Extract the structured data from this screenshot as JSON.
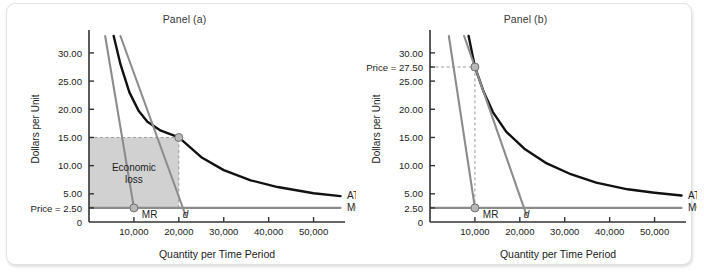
{
  "figure": {
    "background_color": "#ffffff",
    "frame_color": "#e2e2e2"
  },
  "colors": {
    "atc_curve": "#111111",
    "mc_avc_line": "#8c8c8c",
    "demand_line": "#8c8c8c",
    "mr_line": "#8c8c8c",
    "loss_fill": "#cfcfcf",
    "marker_fill": "#b8b8b8",
    "marker_stroke": "#6f6f6f",
    "axis": "#333333",
    "dashed_guide": "#9a9a9a",
    "text": "#1c1c1c"
  },
  "panels": [
    {
      "id": "panel-a",
      "title": "Panel (a)",
      "axis_titles": {
        "y": "Dollars per Unit",
        "x": "Quantity per Time Period"
      },
      "y_ticks": [
        {
          "value": 30.0,
          "label": "30.00"
        },
        {
          "value": 25.0,
          "label": "25.00"
        },
        {
          "value": 20.0,
          "label": "20.00"
        },
        {
          "value": 15.0,
          "label": "15.00"
        },
        {
          "value": 10.0,
          "label": "10.00"
        },
        {
          "value": 5.0,
          "label": "5.00"
        },
        {
          "value": 2.5,
          "label": "Price = 2.50"
        },
        {
          "value": 0.0,
          "label": "0"
        }
      ],
      "x_ticks": [
        {
          "value": 10000,
          "label": "10,000"
        },
        {
          "value": 20000,
          "label": "20,000"
        },
        {
          "value": 30000,
          "label": "30,000"
        },
        {
          "value": 40000,
          "label": "40,000"
        },
        {
          "value": 50000,
          "label": "50,000"
        }
      ],
      "curve_labels": [
        {
          "name": "ATC",
          "text": "ATC"
        },
        {
          "name": "MC = AVC",
          "text": "MC = AVC"
        }
      ],
      "inline_labels": [
        {
          "name": "MR",
          "text": "MR"
        },
        {
          "name": "d",
          "text": "d"
        }
      ],
      "region_label": {
        "line1": "Economic",
        "line2": "loss"
      },
      "price": 2.5,
      "price_label": "Price = 2.50"
    },
    {
      "id": "panel-b",
      "title": "Panel (b)",
      "axis_titles": {
        "y": "Dollars per Unit",
        "x": "Quantity per Time Period"
      },
      "y_ticks": [
        {
          "value": 30.0,
          "label": "30.00"
        },
        {
          "value": 27.5,
          "label": "Price = 27.50"
        },
        {
          "value": 25.0,
          "label": "25.00"
        },
        {
          "value": 20.0,
          "label": "20.00"
        },
        {
          "value": 15.0,
          "label": "15.00"
        },
        {
          "value": 10.0,
          "label": "10.00"
        },
        {
          "value": 5.0,
          "label": "5.00"
        },
        {
          "value": 2.5,
          "label": "2.50"
        },
        {
          "value": 0.0,
          "label": "0"
        }
      ],
      "x_ticks": [
        {
          "value": 10000,
          "label": "10,000"
        },
        {
          "value": 20000,
          "label": "20,000"
        },
        {
          "value": 30000,
          "label": "30,000"
        },
        {
          "value": 40000,
          "label": "40,000"
        },
        {
          "value": 50000,
          "label": "50,000"
        }
      ],
      "curve_labels": [
        {
          "name": "ATC",
          "text": "ATC"
        },
        {
          "name": "MC = AVC",
          "text": "MC = AVC"
        }
      ],
      "inline_labels": [
        {
          "name": "MR",
          "text": "MR"
        },
        {
          "name": "d",
          "text": "d"
        }
      ],
      "price": 27.5,
      "price_label": "Price = 27.50"
    }
  ],
  "chart_data": [
    {
      "type": "line",
      "panel": "Panel (a)",
      "title": "Panel (a)",
      "xlabel": "Quantity per Time Period",
      "ylabel": "Dollars per Unit",
      "xlim": [
        0,
        57000
      ],
      "ylim": [
        0,
        33
      ],
      "xticks": [
        10000,
        20000,
        30000,
        40000,
        50000
      ],
      "yticks": [
        0,
        2.5,
        5,
        10,
        15,
        20,
        25,
        30
      ],
      "grid": false,
      "legend_position": "right-inline",
      "annotations": [
        {
          "text": "Economic loss",
          "x": 10000,
          "y": 9.0
        },
        {
          "text": "Price = 2.50",
          "x": 0,
          "y": 2.5
        },
        {
          "text": "MR",
          "x": 13500,
          "y": 1.2
        },
        {
          "text": "d",
          "x": 21500,
          "y": 1.2
        }
      ],
      "markers": [
        {
          "name": "d-atc-intersection",
          "x": 20000,
          "y": 15.0
        },
        {
          "name": "mr-mc-intersection",
          "x": 10000,
          "y": 2.5
        }
      ],
      "guides": [
        {
          "type": "dashed-horizontal",
          "y": 15.0,
          "x_from": 0,
          "x_to": 20000
        },
        {
          "type": "dashed-vertical",
          "x": 20000,
          "y_from": 2.5,
          "y_to": 15.0
        }
      ],
      "shaded_region": {
        "name": "Economic loss",
        "x_from": 0,
        "x_to": 20000,
        "y_from": 2.5,
        "y_to": 15.0,
        "color": "#cfcfcf"
      },
      "series": [
        {
          "name": "ATC",
          "color": "#111111",
          "x": [
            5500,
            7000,
            9000,
            11000,
            13000,
            16000,
            20000,
            25000,
            30000,
            36000,
            42000,
            50000,
            56000
          ],
          "values": [
            33.0,
            28.0,
            23.0,
            19.8,
            17.8,
            16.2,
            15.0,
            11.5,
            9.2,
            7.4,
            6.2,
            5.1,
            4.6
          ]
        },
        {
          "name": "MC = AVC",
          "color": "#8c8c8c",
          "x": [
            0,
            56000
          ],
          "values": [
            2.5,
            2.5
          ]
        },
        {
          "name": "d",
          "color": "#8c8c8c",
          "x": [
            7000,
            21500
          ],
          "values": [
            33.0,
            1.2
          ]
        },
        {
          "name": "MR",
          "color": "#8c8c8c",
          "x": [
            3600,
            10000
          ],
          "values": [
            33.0,
            2.5
          ]
        }
      ]
    },
    {
      "type": "line",
      "panel": "Panel (b)",
      "title": "Panel (b)",
      "xlabel": "Quantity per Time Period",
      "ylabel": "Dollars per Unit",
      "xlim": [
        0,
        57000
      ],
      "ylim": [
        0,
        33
      ],
      "xticks": [
        10000,
        20000,
        30000,
        40000,
        50000
      ],
      "yticks": [
        0,
        2.5,
        5,
        10,
        15,
        20,
        25,
        27.5,
        30
      ],
      "grid": false,
      "legend_position": "right-inline",
      "annotations": [
        {
          "text": "Price = 27.50",
          "x": 0,
          "y": 27.5
        },
        {
          "text": "MR",
          "x": 13500,
          "y": 1.2
        },
        {
          "text": "d",
          "x": 21500,
          "y": 1.2
        }
      ],
      "markers": [
        {
          "name": "d-atc-tangency",
          "x": 10000,
          "y": 27.5
        },
        {
          "name": "mr-mc-intersection",
          "x": 10000,
          "y": 2.5
        }
      ],
      "guides": [
        {
          "type": "dashed-horizontal",
          "y": 27.5,
          "x_from": 0,
          "x_to": 10000
        },
        {
          "type": "dashed-vertical",
          "x": 10000,
          "y_from": 2.5,
          "y_to": 27.5
        }
      ],
      "series": [
        {
          "name": "ATC",
          "color": "#111111",
          "x": [
            8600,
            10000,
            12000,
            14000,
            17000,
            21000,
            26000,
            31000,
            37000,
            44000,
            50000,
            56000
          ],
          "values": [
            33.0,
            27.5,
            23.0,
            19.5,
            16.0,
            13.0,
            10.4,
            8.6,
            7.0,
            5.8,
            5.2,
            4.7
          ]
        },
        {
          "name": "MC = AVC",
          "color": "#8c8c8c",
          "x": [
            0,
            56000
          ],
          "values": [
            2.5,
            2.5
          ]
        },
        {
          "name": "d",
          "color": "#8c8c8c",
          "x": [
            7600,
            21500
          ],
          "values": [
            33.0,
            1.2
          ]
        },
        {
          "name": "MR",
          "color": "#8c8c8c",
          "x": [
            4200,
            10000
          ],
          "values": [
            33.0,
            2.5
          ]
        }
      ]
    }
  ]
}
